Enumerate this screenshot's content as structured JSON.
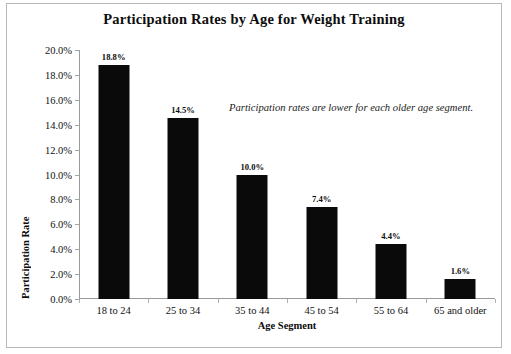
{
  "chart_data": {
    "type": "bar",
    "title": "Participation Rates by Age for Weight Training",
    "xlabel": "Age Segment",
    "ylabel": "Participation Rate",
    "categories": [
      "18 to 24",
      "25 to 34",
      "35 to 44",
      "45 to 54",
      "55 to 64",
      "65 and older"
    ],
    "values": [
      18.8,
      14.5,
      10.0,
      7.4,
      4.4,
      1.6
    ],
    "value_labels": [
      "18.8%",
      "14.5%",
      "10.0%",
      "7.4%",
      "4.4%",
      "1.6%"
    ],
    "ylim": [
      0,
      20
    ],
    "ytick_labels": [
      "0.0%",
      "2.0%",
      "4.0%",
      "6.0%",
      "8.0%",
      "10.0%",
      "12.0%",
      "14.0%",
      "16.0%",
      "18.0%",
      "20.0%"
    ],
    "ytick_values": [
      0,
      2,
      4,
      6,
      8,
      10,
      12,
      14,
      16,
      18,
      20
    ],
    "grid": false,
    "legend": false,
    "annotations": [
      {
        "text": "Participation rates are lower for each older age segment.",
        "style": "italic"
      }
    ],
    "series_color": "#0a0a0a"
  }
}
